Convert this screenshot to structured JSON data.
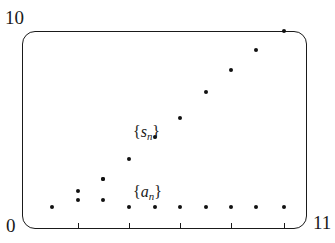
{
  "figure": {
    "axes": {
      "y_max_label": "10",
      "origin_label": "0",
      "x_max_label": "11",
      "frame_style": "rounded-rectangle",
      "grid": false
    },
    "series_labels": {
      "partial_sums": {
        "open_brace": "{",
        "symbol": "s",
        "subscript": "n",
        "close_brace": "}"
      },
      "terms": {
        "open_brace": "{",
        "symbol": "a",
        "subscript": "n",
        "close_brace": "}"
      }
    }
  },
  "chart_data": {
    "type": "scatter",
    "title": "",
    "xlabel": "",
    "ylabel": "",
    "xlim": [
      0,
      11
    ],
    "ylim": [
      0,
      10
    ],
    "grid": false,
    "legend_position": "inline-annotation",
    "x_ticks": [
      2,
      4,
      6,
      8,
      10
    ],
    "y_ticks": [
      0,
      10
    ],
    "series": [
      {
        "name": "{a_n}",
        "marker": "dot",
        "color": "#111111",
        "x": [
          1,
          2,
          2,
          3,
          3,
          4,
          5,
          6,
          7,
          8,
          9,
          10
        ],
        "values": [
          0.28,
          0.62,
          1.05,
          0.62,
          1.62,
          0.62,
          0.62,
          0.62,
          0.62,
          0.62,
          0.62,
          0.62
        ]
      },
      {
        "name": "{s_n}",
        "marker": "dot",
        "color": "#111111",
        "x": [
          3,
          4,
          5,
          6,
          7,
          8,
          9,
          10
        ],
        "values": [
          1.62,
          2.55,
          3.55,
          4.45,
          5.7,
          6.75,
          7.75,
          8.65
        ]
      }
    ]
  },
  "points": {
    "a_series": [
      {
        "x": 52,
        "y": 207
      },
      {
        "x": 78,
        "y": 200
      },
      {
        "x": 78,
        "y": 191
      },
      {
        "x": 103,
        "y": 200
      },
      {
        "x": 103,
        "y": 179
      },
      {
        "x": 129,
        "y": 207
      },
      {
        "x": 155,
        "y": 207
      },
      {
        "x": 180,
        "y": 207
      },
      {
        "x": 206,
        "y": 207
      },
      {
        "x": 231,
        "y": 207
      },
      {
        "x": 256,
        "y": 207
      },
      {
        "x": 284,
        "y": 207
      }
    ],
    "s_series": [
      {
        "x": 103,
        "y": 179
      },
      {
        "x": 129,
        "y": 159
      },
      {
        "x": 155,
        "y": 137
      },
      {
        "x": 180,
        "y": 118
      },
      {
        "x": 206,
        "y": 92
      },
      {
        "x": 231,
        "y": 70
      },
      {
        "x": 256,
        "y": 50
      },
      {
        "x": 284,
        "y": 31
      }
    ]
  },
  "ticks": [
    {
      "x": 78
    },
    {
      "x": 129
    },
    {
      "x": 180
    },
    {
      "x": 231
    },
    {
      "x": 284
    }
  ]
}
